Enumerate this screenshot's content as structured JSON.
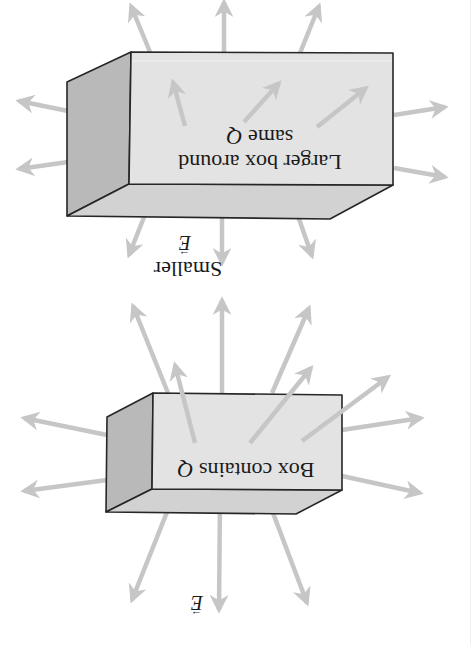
{
  "figure": {
    "orientation": "rotated-180",
    "colors": {
      "background": "#ffffff",
      "front_face": "#e3e3e3",
      "bottom_face": "#d2d2d2",
      "side_face": "#b9b9b9",
      "edge": "#262626",
      "arrow": "#c6c6c6",
      "text": "#1a1a1a"
    },
    "large_box": {
      "label_line1": "Larger box around",
      "label_line2_prefix": "same ",
      "label_line2_var": "Q",
      "outer_field_label_word": "Smaller",
      "outer_field_label_var": "E",
      "vector_mark": "→"
    },
    "small_box": {
      "label_prefix": "Box contains ",
      "label_var": "Q",
      "field_label_var": "E",
      "vector_mark": "→"
    }
  }
}
